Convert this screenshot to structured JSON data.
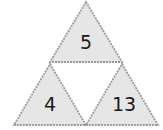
{
  "diagram": {
    "type": "triangle-number-puzzle",
    "colors": {
      "fill": "#e6e6e6",
      "edge": "#9a9a9a",
      "text": "#1a1a1a",
      "background": "#ffffff"
    },
    "triangles": [
      {
        "position": "top",
        "value": "5"
      },
      {
        "position": "bottom-left",
        "value": "4"
      },
      {
        "position": "bottom-right",
        "value": "13"
      },
      {
        "position": "center",
        "value": ""
      }
    ]
  }
}
